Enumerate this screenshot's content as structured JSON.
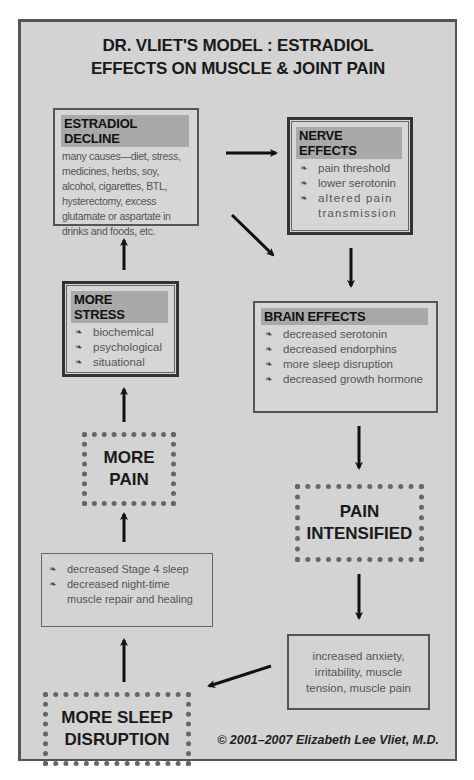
{
  "title": {
    "line1": "DR. VLIET'S MODEL :  ESTRADIOL",
    "line2": "EFFECTS ON MUSCLE & JOINT PAIN"
  },
  "boxes": {
    "estradiol_decline": {
      "heading": "ESTRADIOL DECLINE",
      "text": "many causes—diet, stress, medicines, herbs, soy, alcohol, cigarettes, BTL, hysterectomy, excess glutamate or aspartate in drinks and foods, etc."
    },
    "nerve_effects": {
      "heading": "NERVE EFFECTS",
      "items": [
        "pain threshold",
        "lower serotonin",
        "altered pain transmission"
      ]
    },
    "more_stress": {
      "heading": "MORE STRESS",
      "items": [
        "biochemical",
        "psychological",
        "situational"
      ]
    },
    "brain_effects": {
      "heading": "BRAIN EFFECTS",
      "items": [
        "decreased serotonin",
        "decreased endorphins",
        "more sleep disruption",
        "decreased growth hormone"
      ]
    },
    "more_pain": {
      "line1": "MORE",
      "line2": "PAIN"
    },
    "pain_intensified": {
      "line1": "PAIN",
      "line2": "INTENSIFIED"
    },
    "sleep_effects": {
      "items": [
        "decreased Stage 4 sleep",
        "decreased night-time muscle repair and healing"
      ]
    },
    "anxiety": {
      "text": "increased anxiety, irritability, muscle tension, muscle pain"
    },
    "more_sleep_disruption": {
      "line1": "MORE SLEEP",
      "line2": "DISRUPTION"
    }
  },
  "bullet_glyph": "❧",
  "copyright": "© 2001–2007 Elizabeth Lee Vliet, M.D.",
  "colors": {
    "background": "#d3d3d3",
    "header_band": "#a9a9a9",
    "text_dark": "#1a1a1a",
    "text_body": "#555555"
  }
}
